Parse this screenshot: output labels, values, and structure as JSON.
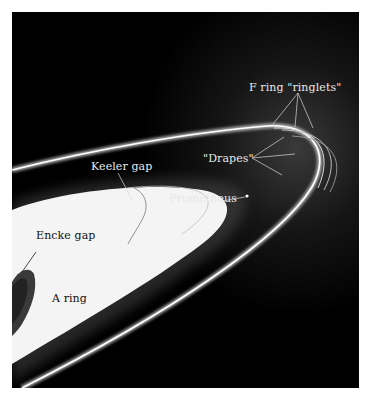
{
  "figure": {
    "labels": {
      "f_ring_ringlets": "F ring \"ringlets\"",
      "drapes": "\"Drapes\"",
      "keeler_gap": "Keeler gap",
      "prometheus": "Prometheus",
      "encke_gap": "Encke gap",
      "a_ring": "A ring"
    },
    "colors": {
      "background": "#000000",
      "ring_bright": "#f2f2f2",
      "label_light": "#e8e8e8",
      "label_dark": "#111111",
      "page": "#ffffff"
    }
  }
}
